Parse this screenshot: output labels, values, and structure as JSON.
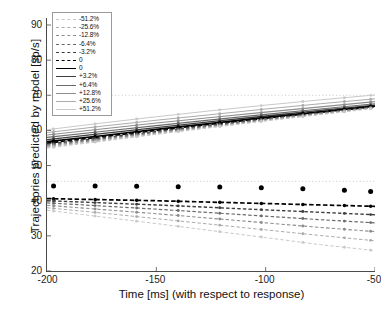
{
  "chart_data": {
    "type": "line",
    "title": "",
    "xlabel": "Time [ms] (with respect to response)",
    "ylabel": "Trajectories predicted by model [sp/s]",
    "xlim": [
      -200,
      -50
    ],
    "ylim": [
      20,
      92
    ],
    "xticks": [
      -200,
      -150,
      -100,
      -50
    ],
    "xticklabels": [
      "-200",
      "-150",
      "-100",
      "-50"
    ],
    "yticks": [
      20,
      30,
      40,
      50,
      60,
      70,
      80,
      90
    ],
    "yticklabels": [
      "20",
      "30",
      "40",
      "50",
      "60",
      "70",
      "80",
      "90"
    ],
    "grid": false,
    "legend_position": "upper left",
    "reference_lines": [
      {
        "y": 70.0,
        "style": "dotted",
        "color": "#bdbdbd"
      },
      {
        "y": 45.5,
        "style": "dotted",
        "color": "#bdbdbd"
      }
    ],
    "sample_times": [
      -197,
      -178,
      -159,
      -140,
      -121,
      -102,
      -83,
      -64,
      -52
    ],
    "legend": [
      {
        "label": "-51.2%",
        "style": "dashed",
        "color": "#c9c9c9",
        "width": 1.0
      },
      {
        "label": "-25.6%",
        "style": "dashed",
        "color": "#ababab",
        "width": 1.0
      },
      {
        "label": "-12.8%",
        "style": "dashed",
        "color": "#8d8d8d",
        "width": 1.1
      },
      {
        "label": "-6.4%",
        "style": "dashed",
        "color": "#6b6b6b",
        "width": 1.2
      },
      {
        "label": "-3.2%",
        "style": "dashed",
        "color": "#3d3d3d",
        "width": 1.4
      },
      {
        "label": "0",
        "style": "dashed",
        "color": "#000000",
        "width": 1.7
      },
      {
        "label": "0",
        "style": "solid",
        "color": "#000000",
        "width": 1.7
      },
      {
        "label": "+3.2%",
        "style": "solid",
        "color": "#3d3d3d",
        "width": 1.4
      },
      {
        "label": "+6.4%",
        "style": "solid",
        "color": "#6b6b6b",
        "width": 1.2
      },
      {
        "label": "+12.8%",
        "style": "solid",
        "color": "#8d8d8d",
        "width": 1.1
      },
      {
        "label": "+25.6%",
        "style": "solid",
        "color": "#ababab",
        "width": 1.0
      },
      {
        "label": "+51.2%",
        "style": "solid",
        "color": "#c9c9c9",
        "width": 1.0
      }
    ],
    "series": [
      {
        "name": "upper +51.2%",
        "group": "upper",
        "style": "solid",
        "color": "#c9c9c9",
        "width": 1.0,
        "x": [
          -200,
          -175,
          -150,
          -125,
          -100,
          -75,
          -50
        ],
        "values": [
          60.2,
          62.1,
          63.9,
          65.6,
          67.2,
          68.7,
          70.1
        ]
      },
      {
        "name": "upper +25.6%",
        "group": "upper",
        "style": "solid",
        "color": "#ababab",
        "width": 1.0,
        "x": [
          -200,
          -175,
          -150,
          -125,
          -100,
          -75,
          -50
        ],
        "values": [
          59.4,
          61.2,
          62.9,
          64.5,
          66.1,
          67.6,
          69.0
        ]
      },
      {
        "name": "upper +12.8%",
        "group": "upper",
        "style": "solid",
        "color": "#8d8d8d",
        "width": 1.1,
        "x": [
          -200,
          -175,
          -150,
          -125,
          -100,
          -75,
          -50
        ],
        "values": [
          58.7,
          60.4,
          62.1,
          63.7,
          65.2,
          66.7,
          68.2
        ]
      },
      {
        "name": "upper +6.4%",
        "group": "upper",
        "style": "solid",
        "color": "#6b6b6b",
        "width": 1.2,
        "x": [
          -200,
          -175,
          -150,
          -125,
          -100,
          -75,
          -50
        ],
        "values": [
          58.0,
          59.7,
          61.4,
          63.0,
          64.6,
          66.1,
          67.6
        ]
      },
      {
        "name": "upper +3.2%",
        "group": "upper",
        "style": "solid",
        "color": "#3d3d3d",
        "width": 1.4,
        "x": [
          -200,
          -175,
          -150,
          -125,
          -100,
          -75,
          -50
        ],
        "values": [
          57.4,
          59.1,
          60.8,
          62.5,
          64.1,
          65.7,
          67.2
        ]
      },
      {
        "name": "upper 0 solid",
        "group": "upper",
        "style": "solid",
        "color": "#000000",
        "width": 1.7,
        "x": [
          -200,
          -175,
          -150,
          -125,
          -100,
          -75,
          -50
        ],
        "values": [
          56.8,
          58.5,
          60.3,
          62.0,
          63.7,
          65.3,
          66.9
        ]
      },
      {
        "name": "upper 0 dashed",
        "group": "upper",
        "style": "dashed",
        "color": "#000000",
        "width": 1.7,
        "x": [
          -200,
          -175,
          -150,
          -125,
          -100,
          -75,
          -50
        ],
        "values": [
          56.4,
          58.2,
          60.0,
          61.8,
          63.5,
          65.2,
          66.8
        ]
      },
      {
        "name": "upper -3.2%",
        "group": "upper",
        "style": "dashed",
        "color": "#3d3d3d",
        "width": 1.4,
        "x": [
          -200,
          -175,
          -150,
          -125,
          -100,
          -75,
          -50
        ],
        "values": [
          56.1,
          57.9,
          59.7,
          61.5,
          63.3,
          65.0,
          66.7
        ]
      },
      {
        "name": "upper -6.4%",
        "group": "upper",
        "style": "dashed",
        "color": "#6b6b6b",
        "width": 1.2,
        "x": [
          -200,
          -175,
          -150,
          -125,
          -100,
          -75,
          -50
        ],
        "values": [
          55.8,
          57.6,
          59.5,
          61.3,
          63.1,
          64.9,
          66.6
        ]
      },
      {
        "name": "upper -12.8%",
        "group": "upper",
        "style": "dashed",
        "color": "#8d8d8d",
        "width": 1.1,
        "x": [
          -200,
          -175,
          -150,
          -125,
          -100,
          -75,
          -50
        ],
        "values": [
          55.5,
          57.4,
          59.3,
          61.1,
          63.0,
          64.8,
          66.5
        ]
      },
      {
        "name": "upper -25.6%",
        "group": "upper",
        "style": "dashed",
        "color": "#ababab",
        "width": 1.0,
        "x": [
          -200,
          -175,
          -150,
          -125,
          -100,
          -75,
          -50
        ],
        "values": [
          55.2,
          57.1,
          59.0,
          60.9,
          62.8,
          64.6,
          66.4
        ]
      },
      {
        "name": "upper -51.2%",
        "group": "upper",
        "style": "dashed",
        "color": "#c9c9c9",
        "width": 1.0,
        "x": [
          -200,
          -175,
          -150,
          -125,
          -100,
          -75,
          -50
        ],
        "values": [
          55.0,
          56.9,
          58.9,
          60.8,
          62.7,
          64.5,
          66.3
        ]
      },
      {
        "name": "lower 0 dashed",
        "group": "lower",
        "style": "dashed",
        "color": "#000000",
        "width": 1.7,
        "x": [
          -200,
          -175,
          -150,
          -125,
          -100,
          -75,
          -50
        ],
        "values": [
          40.6,
          40.3,
          40.0,
          39.6,
          39.2,
          38.8,
          38.4
        ]
      },
      {
        "name": "lower -3.2%",
        "group": "lower",
        "style": "dashed",
        "color": "#3d3d3d",
        "width": 1.4,
        "x": [
          -200,
          -175,
          -150,
          -125,
          -100,
          -75,
          -50
        ],
        "values": [
          40.0,
          39.4,
          38.8,
          38.1,
          37.4,
          36.7,
          36.0
        ]
      },
      {
        "name": "lower -6.4%",
        "group": "lower",
        "style": "dashed",
        "color": "#6b6b6b",
        "width": 1.2,
        "x": [
          -200,
          -175,
          -150,
          -125,
          -100,
          -75,
          -50
        ],
        "values": [
          39.4,
          38.5,
          37.6,
          36.6,
          35.6,
          34.6,
          33.7
        ]
      },
      {
        "name": "lower -12.8%",
        "group": "lower",
        "style": "dashed",
        "color": "#8d8d8d",
        "width": 1.1,
        "x": [
          -200,
          -175,
          -150,
          -125,
          -100,
          -75,
          -50
        ],
        "values": [
          38.7,
          37.5,
          36.3,
          35.0,
          33.7,
          32.4,
          31.2
        ]
      },
      {
        "name": "lower -25.6%",
        "group": "lower",
        "style": "dashed",
        "color": "#ababab",
        "width": 1.0,
        "x": [
          -200,
          -175,
          -150,
          -125,
          -100,
          -75,
          -50
        ],
        "values": [
          38.0,
          36.5,
          34.9,
          33.3,
          31.7,
          30.1,
          28.6
        ]
      },
      {
        "name": "lower -51.2%",
        "group": "lower",
        "style": "dashed",
        "color": "#c9c9c9",
        "width": 1.0,
        "x": [
          -200,
          -175,
          -150,
          -125,
          -100,
          -75,
          -50
        ],
        "values": [
          37.3,
          35.4,
          33.5,
          31.5,
          29.5,
          27.5,
          25.8
        ]
      },
      {
        "name": "black dot row",
        "group": "dots",
        "style": "markers",
        "color": "#000000",
        "width": 0,
        "x": [
          -197,
          -178,
          -159,
          -140,
          -121,
          -102,
          -83,
          -64,
          -52
        ],
        "values": [
          44.2,
          44.2,
          44.1,
          44.0,
          43.9,
          43.7,
          43.4,
          43.0,
          42.6
        ]
      }
    ]
  }
}
